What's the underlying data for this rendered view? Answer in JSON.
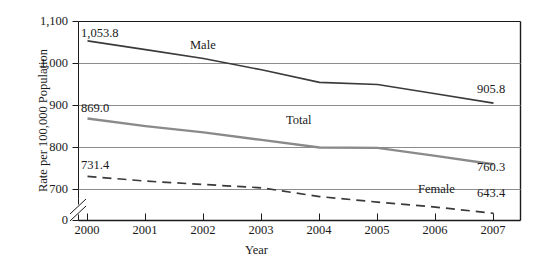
{
  "chart_data": {
    "type": "line",
    "title": "",
    "xlabel": "Year",
    "ylabel": "Rate per 100,000 Population",
    "categories": [
      "2000",
      "2001",
      "2002",
      "2003",
      "2004",
      "2005",
      "2006",
      "2007"
    ],
    "x": [
      2000,
      2001,
      2002,
      2003,
      2004,
      2005,
      2006,
      2007
    ],
    "ylim": [
      700,
      1100
    ],
    "yticks": [
      "0",
      "700",
      "800",
      "900",
      "1,000",
      "1,100"
    ],
    "ytick_values": [
      0,
      700,
      800,
      900,
      1000,
      1100
    ],
    "axis_break": true,
    "grid": true,
    "grid_axis": "y",
    "legend_position": "inline-labels",
    "series": [
      {
        "name": "Male",
        "style": "solid",
        "color": "#3a3a3a",
        "values": [
          1053.8,
          1033.0,
          1012.0,
          985.0,
          955.0,
          950.0,
          928.0,
          905.8
        ],
        "start_label": "1,053.8",
        "end_label": "905.8"
      },
      {
        "name": "Total",
        "style": "solid",
        "color": "#8a8a8a",
        "values": [
          869.0,
          851.0,
          836.0,
          818.0,
          800.0,
          799.0,
          780.0,
          760.3
        ],
        "start_label": "869.0",
        "end_label": "760.3"
      },
      {
        "name": "Female",
        "style": "dashed",
        "color": "#3a3a3a",
        "values": [
          731.4,
          720.0,
          712.0,
          704.0,
          683.0,
          670.0,
          658.0,
          643.4
        ],
        "start_label": "731.4",
        "end_label": "643.4"
      }
    ],
    "annotations": [
      {
        "text": "1,053.8",
        "series": "Male",
        "position": "start"
      },
      {
        "text": "905.8",
        "series": "Male",
        "position": "end"
      },
      {
        "text": "869.0",
        "series": "Total",
        "position": "start"
      },
      {
        "text": "760.3",
        "series": "Total",
        "position": "end"
      },
      {
        "text": "731.4",
        "series": "Female",
        "position": "start"
      },
      {
        "text": "643.4",
        "series": "Female",
        "position": "end"
      },
      {
        "text": "Male",
        "series": "Male",
        "position": "inline"
      },
      {
        "text": "Total",
        "series": "Total",
        "position": "inline"
      },
      {
        "text": "Female",
        "series": "Female",
        "position": "inline"
      }
    ]
  },
  "axis": {
    "y_title": "Rate per 100,000 Population",
    "x_title": "Year",
    "y_ticks": [
      {
        "label": "1,100"
      },
      {
        "label": "1,000"
      },
      {
        "label": "900"
      },
      {
        "label": "800"
      },
      {
        "label": "700"
      },
      {
        "label": "0"
      }
    ],
    "x_ticks": [
      {
        "label": "2000"
      },
      {
        "label": "2001"
      },
      {
        "label": "2002"
      },
      {
        "label": "2003"
      },
      {
        "label": "2004"
      },
      {
        "label": "2005"
      },
      {
        "label": "2006"
      },
      {
        "label": "2007"
      }
    ]
  },
  "labels": {
    "male_start": "1,053.8",
    "male_end": "905.8",
    "male_name": "Male",
    "total_start": "869.0",
    "total_end": "760.3",
    "total_name": "Total",
    "female_start": "731.4",
    "female_end": "643.4",
    "female_name": "Female"
  },
  "colors": {
    "male_line": "#3a3a3a",
    "total_line": "#8a8a8a",
    "female_line": "#3a3a3a",
    "gridline": "#8c8c8c",
    "frame": "#1a1a1a",
    "text": "#1a1a1a",
    "background": "#ffffff"
  }
}
